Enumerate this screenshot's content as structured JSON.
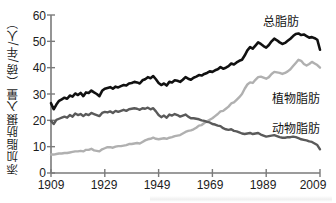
{
  "chart_data": {
    "type": "line",
    "title": "",
    "xlabel": "",
    "ylabel": "添加脂肪摄入量（磅/年/人）",
    "xlim": [
      1909,
      2009
    ],
    "ylim": [
      0,
      60
    ],
    "grid": false,
    "legend_position": "inline-right",
    "xticks": [
      "1909",
      "1929",
      "1949",
      "1969",
      "1989",
      "2009"
    ],
    "xtick_values": [
      1909,
      1929,
      1949,
      1969,
      1989,
      2009
    ],
    "yticks": [
      "0",
      "10",
      "20",
      "30",
      "40",
      "50",
      "60"
    ],
    "ytick_values": [
      0,
      10,
      20,
      30,
      40,
      50,
      60
    ],
    "x": [
      1909,
      1910,
      1911,
      1912,
      1913,
      1914,
      1915,
      1916,
      1917,
      1918,
      1919,
      1920,
      1921,
      1922,
      1923,
      1924,
      1925,
      1926,
      1927,
      1928,
      1929,
      1930,
      1931,
      1932,
      1933,
      1934,
      1935,
      1936,
      1937,
      1938,
      1939,
      1940,
      1941,
      1942,
      1943,
      1944,
      1945,
      1946,
      1947,
      1948,
      1949,
      1950,
      1951,
      1952,
      1953,
      1954,
      1955,
      1956,
      1957,
      1958,
      1959,
      1960,
      1961,
      1962,
      1963,
      1964,
      1965,
      1966,
      1967,
      1968,
      1969,
      1970,
      1971,
      1972,
      1973,
      1974,
      1975,
      1976,
      1977,
      1978,
      1979,
      1980,
      1981,
      1982,
      1983,
      1984,
      1985,
      1986,
      1987,
      1988,
      1989,
      1990,
      1991,
      1992,
      1993,
      1994,
      1995,
      1996,
      1997,
      1998,
      1999,
      2000,
      2001,
      2002,
      2003,
      2004,
      2005,
      2006,
      2007,
      2008,
      2009
    ],
    "series": [
      {
        "name": "总脂肪",
        "label": "总脂肪",
        "color": "#111111",
        "width": 2.6,
        "values": [
          26.5,
          24.2,
          26.0,
          27.4,
          28.0,
          28.6,
          28.2,
          29.4,
          29.0,
          30.2,
          29.6,
          30.4,
          29.2,
          30.6,
          30.4,
          31.3,
          30.6,
          30.0,
          29.2,
          31.2,
          32.0,
          32.3,
          32.6,
          32.0,
          32.8,
          32.5,
          33.0,
          33.4,
          33.2,
          34.0,
          34.2,
          34.6,
          34.4,
          34.0,
          35.2,
          35.6,
          36.4,
          36.0,
          36.8,
          35.6,
          34.2,
          33.4,
          34.0,
          33.2,
          34.6,
          34.4,
          35.2,
          35.0,
          34.6,
          35.4,
          36.4,
          35.8,
          35.4,
          36.2,
          36.6,
          37.2,
          37.0,
          37.6,
          38.0,
          38.6,
          38.4,
          39.0,
          39.4,
          40.2,
          39.6,
          40.0,
          40.6,
          41.6,
          41.2,
          42.0,
          42.6,
          43.0,
          44.6,
          46.6,
          47.8,
          47.2,
          48.4,
          49.6,
          49.0,
          48.2,
          47.6,
          48.6,
          50.0,
          51.0,
          50.4,
          49.6,
          49.0,
          49.4,
          50.2,
          51.0,
          52.0,
          52.8,
          53.0,
          52.4,
          52.6,
          52.0,
          51.4,
          51.6,
          51.2,
          50.6,
          46.8
        ]
      },
      {
        "name": "动物脂肪",
        "label": "动物脂肪",
        "color": "#5a5a5a",
        "width": 2.4,
        "values": [
          19.8,
          18.6,
          20.2,
          20.6,
          21.0,
          21.4,
          21.0,
          22.0,
          21.4,
          22.6,
          22.0,
          22.4,
          21.6,
          22.4,
          22.0,
          22.8,
          22.4,
          22.0,
          21.6,
          22.8,
          23.2,
          23.0,
          23.4,
          22.8,
          23.6,
          23.2,
          23.6,
          24.0,
          23.6,
          24.2,
          24.4,
          24.6,
          24.4,
          24.0,
          24.6,
          24.4,
          24.8,
          24.2,
          24.6,
          23.4,
          22.0,
          21.2,
          21.8,
          21.0,
          22.2,
          21.8,
          22.4,
          22.0,
          21.4,
          21.8,
          22.2,
          21.4,
          20.8,
          20.8,
          20.6,
          20.4,
          20.0,
          19.8,
          19.4,
          19.2,
          18.6,
          18.4,
          18.0,
          17.8,
          17.0,
          16.6,
          16.4,
          16.6,
          16.0,
          15.8,
          15.4,
          15.0,
          14.8,
          15.0,
          15.2,
          14.8,
          15.0,
          15.2,
          14.6,
          14.2,
          13.8,
          14.0,
          14.2,
          14.4,
          14.0,
          13.6,
          13.4,
          13.4,
          13.6,
          13.6,
          13.8,
          13.6,
          13.2,
          12.8,
          12.6,
          12.4,
          12.0,
          11.8,
          11.2,
          10.6,
          9.0
        ]
      },
      {
        "name": "植物脂肪",
        "label": "植物脂肪",
        "color": "#b0b0b0",
        "width": 2.4,
        "values": [
          7.0,
          7.0,
          7.2,
          7.4,
          7.4,
          7.6,
          7.6,
          7.8,
          8.0,
          8.2,
          8.2,
          8.4,
          8.2,
          8.8,
          8.8,
          9.2,
          8.6,
          8.4,
          8.2,
          9.0,
          9.4,
          9.8,
          9.8,
          9.6,
          10.0,
          10.2,
          10.2,
          10.4,
          10.6,
          11.0,
          11.0,
          11.2,
          11.4,
          11.2,
          11.8,
          12.4,
          12.8,
          13.0,
          13.4,
          13.0,
          12.8,
          13.0,
          13.2,
          13.0,
          13.4,
          13.6,
          14.0,
          14.2,
          14.4,
          15.0,
          15.6,
          16.0,
          16.2,
          16.6,
          17.2,
          18.0,
          18.2,
          19.0,
          19.6,
          20.2,
          20.8,
          21.6,
          22.4,
          23.4,
          23.6,
          24.4,
          25.2,
          26.4,
          26.8,
          27.8,
          28.8,
          30.0,
          32.0,
          33.6,
          34.4,
          34.2,
          35.4,
          36.4,
          36.6,
          36.2,
          35.8,
          36.4,
          37.6,
          38.4,
          38.2,
          38.0,
          37.6,
          38.0,
          38.6,
          39.4,
          40.6,
          41.8,
          43.0,
          42.6,
          41.4,
          40.8,
          41.4,
          42.2,
          41.6,
          41.0,
          40.0
        ]
      }
    ]
  },
  "labels": {
    "total_fat": "总脂肪",
    "vegetable_fat": "植物脂肪",
    "animal_fat": "动物脂肪"
  }
}
